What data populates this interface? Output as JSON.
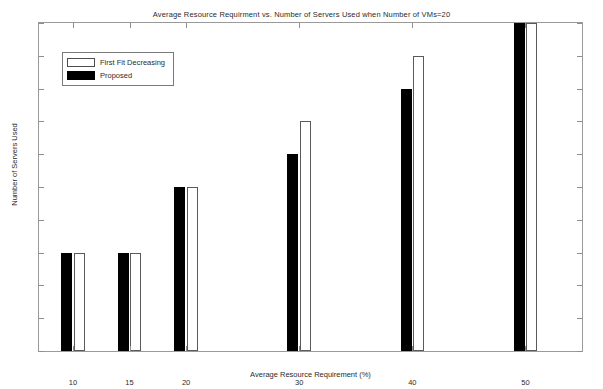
{
  "chart_data": {
    "type": "bar",
    "title": "Average Resource Requirment vs. Number of Servers Used when Number of VMs=20",
    "xlabel": "Average Resource Requirement (%)",
    "ylabel": "Number of Servers Used",
    "categories": [
      10,
      15,
      20,
      30,
      40,
      50
    ],
    "x": [
      10,
      15,
      20,
      30,
      40,
      50
    ],
    "xtick_labels": [
      "10",
      "15",
      "20",
      "30",
      "40",
      "50"
    ],
    "ytick_labels": [
      "0",
      "1",
      "2",
      "3",
      "4",
      "5",
      "6",
      "7",
      "8",
      "9",
      "10"
    ],
    "xlim": [
      7,
      55
    ],
    "ylim": [
      0,
      10
    ],
    "grid": false,
    "legend_position": "upper left",
    "series": [
      {
        "name": "Proposed",
        "color": "#000000",
        "values": [
          3,
          3,
          5,
          6,
          8,
          10
        ]
      },
      {
        "name": "First Fit Decreasing",
        "color": "#ffffff",
        "values": [
          3,
          3,
          5,
          7,
          9,
          10
        ]
      }
    ]
  },
  "legend": {
    "entries": [
      {
        "label": "First Fit Decreasing",
        "swatch": "white-bar-swatch"
      },
      {
        "label": "Proposed",
        "swatch": "black-bar-swatch"
      }
    ]
  }
}
